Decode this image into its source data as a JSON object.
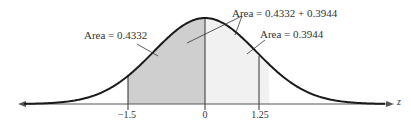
{
  "chart_data": {
    "type": "area",
    "title": "",
    "xlabel": "z",
    "ylabel": "",
    "distribution": "standard normal",
    "tick_labels": [
      "-1.5",
      "0",
      "1.25"
    ],
    "ticks": [
      -1.5,
      0,
      1.25
    ],
    "shaded_regions": [
      {
        "from": -1.5,
        "to": 0,
        "area": 0.4332,
        "shade": "dark"
      },
      {
        "from": 0,
        "to": 1.25,
        "area": 0.3944,
        "shade": "light"
      }
    ],
    "annotations": [
      "Area = 0.4332",
      "Area = 0.4332 + 0.3944",
      "Area = 0.3944"
    ],
    "grid": false
  },
  "labels": {
    "left_area": "Area = 0.4332",
    "total_area": "Area = 0.4332 + 0.3944",
    "right_area": "Area = 0.3944",
    "tick_neg": "−1.5",
    "tick_zero": "0",
    "tick_pos": "1.25",
    "axis": "z"
  },
  "colors": {
    "curve": "#1a1a1a",
    "dark_fill": "#cfcfcf",
    "light_fill": "#f1f1f1",
    "axis": "#555555"
  }
}
